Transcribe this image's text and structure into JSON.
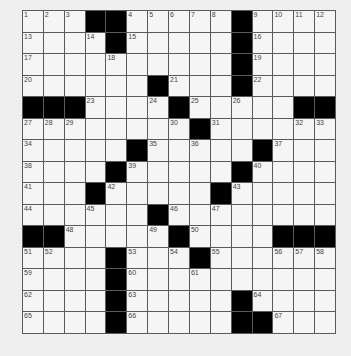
{
  "puzzle": {
    "rows": 15,
    "cols": 15,
    "layout": [
      "...##.....#....",
      "....#.....#....",
      "..........#....",
      "......#...#....",
      "###....#.....##",
      "........#......",
      ".....#.....#...",
      "....#.....#....",
      "...#.....#.....",
      "......#........",
      "##.....#....###",
      "....#...#......",
      "....#..........",
      "....#.....#....",
      "....#.....##..."
    ],
    "numbers": [
      {
        "r": 0,
        "c": 0,
        "n": "1"
      },
      {
        "r": 0,
        "c": 1,
        "n": "2"
      },
      {
        "r": 0,
        "c": 2,
        "n": "3"
      },
      {
        "r": 0,
        "c": 5,
        "n": "4"
      },
      {
        "r": 0,
        "c": 6,
        "n": "5"
      },
      {
        "r": 0,
        "c": 7,
        "n": "6"
      },
      {
        "r": 0,
        "c": 8,
        "n": "7"
      },
      {
        "r": 0,
        "c": 9,
        "n": "8"
      },
      {
        "r": 0,
        "c": 11,
        "n": "9"
      },
      {
        "r": 0,
        "c": 12,
        "n": "10"
      },
      {
        "r": 0,
        "c": 13,
        "n": "11"
      },
      {
        "r": 0,
        "c": 14,
        "n": "12"
      },
      {
        "r": 1,
        "c": 0,
        "n": "13"
      },
      {
        "r": 1,
        "c": 3,
        "n": "14"
      },
      {
        "r": 1,
        "c": 5,
        "n": "15"
      },
      {
        "r": 1,
        "c": 11,
        "n": "16"
      },
      {
        "r": 2,
        "c": 0,
        "n": "17"
      },
      {
        "r": 2,
        "c": 4,
        "n": "18"
      },
      {
        "r": 2,
        "c": 11,
        "n": "19"
      },
      {
        "r": 3,
        "c": 0,
        "n": "20"
      },
      {
        "r": 3,
        "c": 7,
        "n": "21"
      },
      {
        "r": 3,
        "c": 11,
        "n": "22"
      },
      {
        "r": 4,
        "c": 3,
        "n": "23"
      },
      {
        "r": 4,
        "c": 6,
        "n": "24"
      },
      {
        "r": 4,
        "c": 8,
        "n": "25"
      },
      {
        "r": 4,
        "c": 10,
        "n": "26"
      },
      {
        "r": 5,
        "c": 0,
        "n": "27"
      },
      {
        "r": 5,
        "c": 1,
        "n": "28"
      },
      {
        "r": 5,
        "c": 2,
        "n": "29"
      },
      {
        "r": 5,
        "c": 7,
        "n": "30"
      },
      {
        "r": 5,
        "c": 9,
        "n": "31"
      },
      {
        "r": 5,
        "c": 13,
        "n": "32"
      },
      {
        "r": 5,
        "c": 14,
        "n": "33"
      },
      {
        "r": 6,
        "c": 0,
        "n": "34"
      },
      {
        "r": 6,
        "c": 6,
        "n": "35"
      },
      {
        "r": 6,
        "c": 8,
        "n": "36"
      },
      {
        "r": 6,
        "c": 12,
        "n": "37"
      },
      {
        "r": 7,
        "c": 0,
        "n": "38"
      },
      {
        "r": 7,
        "c": 5,
        "n": "39"
      },
      {
        "r": 7,
        "c": 11,
        "n": "40"
      },
      {
        "r": 8,
        "c": 0,
        "n": "41"
      },
      {
        "r": 8,
        "c": 4,
        "n": "42"
      },
      {
        "r": 8,
        "c": 10,
        "n": "43"
      },
      {
        "r": 9,
        "c": 0,
        "n": "44"
      },
      {
        "r": 9,
        "c": 3,
        "n": "45"
      },
      {
        "r": 9,
        "c": 7,
        "n": "46"
      },
      {
        "r": 9,
        "c": 9,
        "n": "47"
      },
      {
        "r": 10,
        "c": 2,
        "n": "48"
      },
      {
        "r": 10,
        "c": 6,
        "n": "49"
      },
      {
        "r": 10,
        "c": 8,
        "n": "50"
      },
      {
        "r": 11,
        "c": 0,
        "n": "51"
      },
      {
        "r": 11,
        "c": 1,
        "n": "52"
      },
      {
        "r": 11,
        "c": 5,
        "n": "53"
      },
      {
        "r": 11,
        "c": 7,
        "n": "54"
      },
      {
        "r": 11,
        "c": 9,
        "n": "55"
      },
      {
        "r": 11,
        "c": 12,
        "n": "56"
      },
      {
        "r": 11,
        "c": 13,
        "n": "57"
      },
      {
        "r": 11,
        "c": 14,
        "n": "58"
      },
      {
        "r": 12,
        "c": 0,
        "n": "59"
      },
      {
        "r": 12,
        "c": 5,
        "n": "60"
      },
      {
        "r": 12,
        "c": 8,
        "n": "61"
      },
      {
        "r": 13,
        "c": 0,
        "n": "62"
      },
      {
        "r": 13,
        "c": 5,
        "n": "63"
      },
      {
        "r": 13,
        "c": 11,
        "n": "64"
      },
      {
        "r": 14,
        "c": 0,
        "n": "65"
      },
      {
        "r": 14,
        "c": 5,
        "n": "66"
      },
      {
        "r": 14,
        "c": 12,
        "n": "67"
      }
    ]
  },
  "colors": {
    "block": "#000000",
    "cell": "#f5f5f5",
    "gridline": "#5a5a5a",
    "number": "#444444",
    "background": "#efefef"
  }
}
